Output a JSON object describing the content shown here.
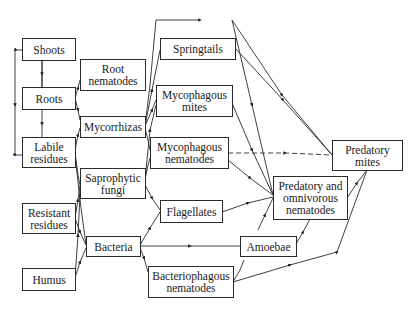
{
  "diagram": {
    "type": "soil food web",
    "nodes": [
      {
        "id": "shoots",
        "label": "Shoots"
      },
      {
        "id": "roots",
        "label": "Roots"
      },
      {
        "id": "labile_residues",
        "label": "Labile residues"
      },
      {
        "id": "resistant_residues",
        "label": "Resistant residues"
      },
      {
        "id": "humus",
        "label": "Humus"
      },
      {
        "id": "root_nematodes",
        "label": "Root nematodes"
      },
      {
        "id": "mycorrhizas",
        "label": "Mycorrhizas"
      },
      {
        "id": "saprophytic_fungi",
        "label": "Saprophytic fungi"
      },
      {
        "id": "bacteria",
        "label": "Bacteria"
      },
      {
        "id": "springtails",
        "label": "Springtails"
      },
      {
        "id": "mycophagous_mites",
        "label": "Mycophagous mites"
      },
      {
        "id": "mycophagous_nematodes",
        "label": "Mycophagous nematodes"
      },
      {
        "id": "flagellates",
        "label": "Flagellates"
      },
      {
        "id": "bacteriophagous_nematodes",
        "label": "Bacteriophagous nematodes"
      },
      {
        "id": "amoebae",
        "label": "Amoebae"
      },
      {
        "id": "predatory_omnivorous_nematodes",
        "label": "Predatory and omnivorous nematodes"
      },
      {
        "id": "predatory_mites",
        "label": "Predatory mites"
      }
    ],
    "edges": [
      {
        "from": "shoots",
        "to": "roots"
      },
      {
        "from": "roots",
        "to": "labile_residues"
      },
      {
        "from": "shoots",
        "to": "labile_residues",
        "style": "feedback-left"
      },
      {
        "from": "roots",
        "to": "root_nematodes"
      },
      {
        "from": "roots",
        "to": "mycorrhizas"
      },
      {
        "from": "labile_residues",
        "to": "saprophytic_fungi"
      },
      {
        "from": "labile_residues",
        "to": "bacteria"
      },
      {
        "from": "resistant_residues",
        "to": "saprophytic_fungi"
      },
      {
        "from": "resistant_residues",
        "to": "bacteria"
      },
      {
        "from": "humus",
        "to": "saprophytic_fungi"
      },
      {
        "from": "humus",
        "to": "bacteria"
      },
      {
        "from": "mycorrhizas",
        "to": "springtails"
      },
      {
        "from": "mycorrhizas",
        "to": "mycophagous_mites"
      },
      {
        "from": "mycorrhizas",
        "to": "mycophagous_nematodes"
      },
      {
        "from": "saprophytic_fungi",
        "to": "mycophagous_mites"
      },
      {
        "from": "saprophytic_fungi",
        "to": "mycophagous_nematodes"
      },
      {
        "from": "saprophytic_fungi",
        "to": "flagellates"
      },
      {
        "from": "bacteria",
        "to": "flagellates"
      },
      {
        "from": "bacteria",
        "to": "amoebae"
      },
      {
        "from": "bacteria",
        "to": "bacteriophagous_nematodes"
      },
      {
        "from": "root_nematodes",
        "to": "predatory_mites"
      },
      {
        "from": "root_nematodes",
        "to": "predatory_omnivorous_nematodes"
      },
      {
        "from": "springtails",
        "to": "predatory_mites"
      },
      {
        "from": "mycophagous_mites",
        "to": "predatory_omnivorous_nematodes"
      },
      {
        "from": "mycophagous_nematodes",
        "to": "predatory_mites",
        "style": "dashed"
      },
      {
        "from": "mycophagous_nematodes",
        "to": "predatory_omnivorous_nematodes"
      },
      {
        "from": "flagellates",
        "to": "predatory_omnivorous_nematodes"
      },
      {
        "from": "amoebae",
        "to": "predatory_omnivorous_nematodes"
      },
      {
        "from": "bacteriophagous_nematodes",
        "to": "predatory_omnivorous_nematodes"
      },
      {
        "from": "bacteriophagous_nematodes",
        "to": "predatory_mites"
      },
      {
        "from": "predatory_omnivorous_nematodes",
        "to": "predatory_mites"
      }
    ]
  }
}
